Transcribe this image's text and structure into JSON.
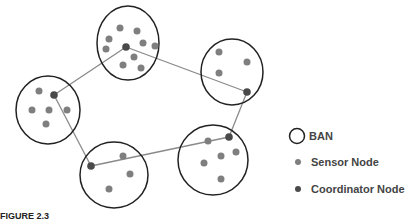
{
  "legend": {
    "ban_label": "BAN",
    "sensor_label": "Sensor Node",
    "coordinator_label": "Coordinator Node"
  },
  "caption": "FIGURE 2.3",
  "colors": {
    "ban_stroke": "#222222",
    "sensor": "#7f7f7f",
    "coordinator": "#4a4a4a",
    "link": "#8a8a8a"
  },
  "bans": [
    {
      "id": "top",
      "cx": 128,
      "cy": 43,
      "rx": 31,
      "ry": 37,
      "coordinator": [
        126,
        47
      ],
      "sensors": [
        [
          120,
          28
        ],
        [
          137,
          31
        ],
        [
          109,
          39
        ],
        [
          143,
          43
        ],
        [
          155,
          46
        ],
        [
          106,
          49
        ],
        [
          134,
          57
        ],
        [
          123,
          65
        ],
        [
          141,
          68
        ]
      ]
    },
    {
      "id": "right-top",
      "cx": 232,
      "cy": 72,
      "rx": 31,
      "ry": 33,
      "coordinator": [
        247,
        92
      ],
      "sensors": [
        [
          219,
          52
        ],
        [
          247,
          62
        ],
        [
          219,
          73
        ]
      ]
    },
    {
      "id": "left",
      "cx": 48,
      "cy": 110,
      "rx": 32,
      "ry": 34,
      "coordinator": [
        54,
        95
      ],
      "sensors": [
        [
          39,
          91
        ],
        [
          32,
          110
        ],
        [
          49,
          110
        ],
        [
          67,
          110
        ],
        [
          46,
          124
        ]
      ]
    },
    {
      "id": "bottom-left",
      "cx": 114,
      "cy": 175,
      "rx": 34,
      "ry": 33,
      "coordinator": [
        91,
        166
      ],
      "sensors": [
        [
          123,
          156
        ],
        [
          130,
          174
        ],
        [
          109,
          189
        ]
      ]
    },
    {
      "id": "bottom-right",
      "cx": 213,
      "cy": 160,
      "rx": 35,
      "ry": 35,
      "coordinator": [
        229,
        137
      ],
      "sensors": [
        [
          208,
          141
        ],
        [
          221,
          156
        ],
        [
          236,
          152
        ],
        [
          204,
          163
        ],
        [
          221,
          179
        ]
      ]
    }
  ],
  "links": [
    [
      "top",
      "right-top"
    ],
    [
      "right-top",
      "bottom-right"
    ],
    [
      "bottom-right",
      "bottom-left"
    ],
    [
      "bottom-left",
      "left"
    ],
    [
      "left",
      "top"
    ]
  ]
}
